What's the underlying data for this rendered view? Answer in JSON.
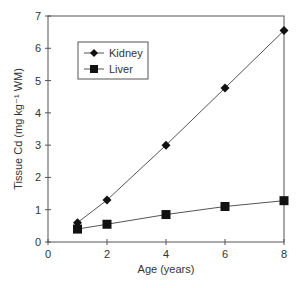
{
  "chart_data": {
    "type": "line",
    "title": "",
    "xlabel": "Age (years)",
    "ylabel": "Tissue Cd (mg kg⁻¹ WM)",
    "xlim": [
      0,
      8
    ],
    "ylim": [
      0,
      7
    ],
    "xticks": [
      0,
      2,
      4,
      6,
      8
    ],
    "yticks": [
      0,
      1,
      2,
      3,
      4,
      5,
      6,
      7
    ],
    "grid": false,
    "legend_position": "upper-left-inside",
    "series": [
      {
        "name": "Kidney",
        "marker": "diamond",
        "x": [
          1,
          2,
          4,
          6,
          8
        ],
        "values": [
          0.6,
          1.3,
          3.0,
          4.77,
          6.55
        ]
      },
      {
        "name": "Liver",
        "marker": "square",
        "x": [
          1,
          2,
          4,
          6,
          8
        ],
        "values": [
          0.4,
          0.55,
          0.85,
          1.1,
          1.28
        ]
      }
    ]
  },
  "legend": {
    "items": [
      {
        "label": "Kidney"
      },
      {
        "label": "Liver"
      }
    ]
  },
  "colors": {
    "line": "#555555",
    "marker": "#111111",
    "axis": "#555555",
    "text": "#333333"
  }
}
